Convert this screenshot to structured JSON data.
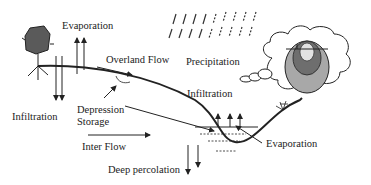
{
  "labels": {
    "evaporation_top": "Evaporation",
    "overland_flow": "Overland Flow",
    "precipitation": "Precipitation",
    "infiltration_left": "Infiltration",
    "infiltration_right": "Infiltration",
    "depression_line1": "Depression",
    "depression_line2": "Storage",
    "inter_flow": "Inter Flow",
    "evaporation_bottom": "Evaporation",
    "deep_percolation": "Deep percolation"
  },
  "icons": [
    "tree-icon",
    "rain-icon",
    "cloud-icon",
    "sun-icon",
    "grass-icon",
    "arrow-icon"
  ],
  "colors": {
    "line": "#222222",
    "sun_outer": "#a8a8a8",
    "sun_middle": "#6e6e6e",
    "sun_inner": "#e2e2e2",
    "tree": "#5a5a5a"
  }
}
